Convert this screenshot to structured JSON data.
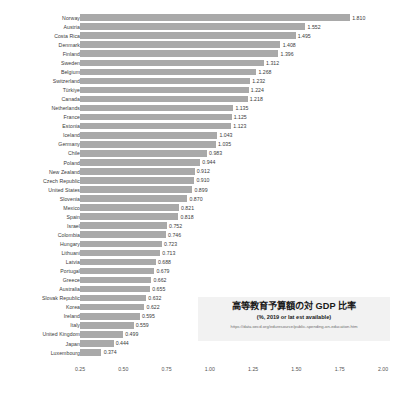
{
  "chart_data": {
    "type": "bar",
    "orientation": "horizontal",
    "title": "高等教育予算額の対 GDP 比率",
    "subtitle": "(%, 2019 or lat est available)",
    "source_url": "https://data.oecd.org/eduresource/public-spending-on-education.htm",
    "xlabel": "",
    "ylabel": "",
    "xlim": [
      0.25,
      2.0
    ],
    "grid": false,
    "legend": "none",
    "bar_color": "#a9a9a9",
    "xticks": [
      "0.25",
      "0.50",
      "0.75",
      "1.00",
      "1.25",
      "1.50",
      "1.75",
      "2.00"
    ],
    "xtick_values": [
      0.25,
      0.5,
      0.75,
      1.0,
      1.25,
      1.5,
      1.75,
      2.0
    ],
    "categories": [
      "Norway",
      "Austria",
      "Costa Rica",
      "Denmark",
      "Finland",
      "Sweden",
      "Belgium",
      "Switzerland",
      "Türkiye",
      "Canada",
      "Netherlands",
      "France",
      "Estonia",
      "Iceland",
      "Germany",
      "Chile",
      "Poland",
      "New Zealand",
      "Czech Republic",
      "United States",
      "Slovenia",
      "Mexico",
      "Spain",
      "Israel",
      "Colombia",
      "Hungary",
      "Lithuani",
      "Latvia",
      "Portugal",
      "Greece",
      "Australia",
      "Slovak Republic",
      "Korea",
      "Ireland",
      "Italy",
      "United Kingdom",
      "Japan",
      "Luxembourg"
    ],
    "values": [
      1.81,
      1.552,
      1.495,
      1.408,
      1.396,
      1.312,
      1.268,
      1.232,
      1.224,
      1.218,
      1.135,
      1.125,
      1.123,
      1.043,
      1.035,
      0.983,
      0.944,
      0.912,
      0.91,
      0.899,
      0.87,
      0.821,
      0.818,
      0.752,
      0.746,
      0.723,
      0.713,
      0.688,
      0.679,
      0.662,
      0.655,
      0.632,
      0.622,
      0.595,
      0.559,
      0.499,
      0.444,
      0.374
    ],
    "value_labels": [
      "1.810",
      "1.552",
      "1.495",
      "1.408",
      "1.396",
      "1.312",
      "1.268",
      "1.232",
      "1.224",
      "1.218",
      "1.135",
      "1.125",
      "1.123",
      "1.043",
      "1.035",
      "0.983",
      "0.944",
      "0.912",
      "0.910",
      "0.899",
      "0.870",
      "0.821",
      "0.818",
      "0.752",
      "0.746",
      "0.723",
      "0.713",
      "0.688",
      "0.679",
      "0.662",
      "0.655",
      "0.632",
      "0.622",
      "0.595",
      "0.559",
      "0.499",
      "0.444",
      "0.374"
    ]
  }
}
